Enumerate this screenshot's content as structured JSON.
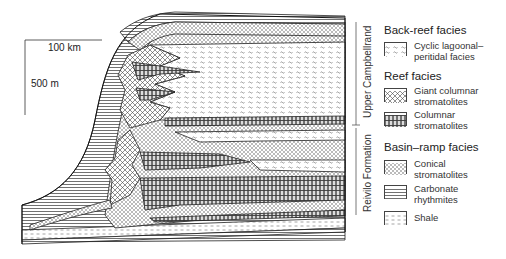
{
  "scale_bar": {
    "horizontal_label": "100 km",
    "vertical_label": "500 m"
  },
  "formations": [
    {
      "label": "Upper Campbellrand"
    },
    {
      "label": "Reivilo Formation"
    }
  ],
  "legend": {
    "groups": [
      {
        "title": "Back-reef facies",
        "items": [
          {
            "label": "Cyclic lagoonal–\nperitidal facies",
            "pattern": "wavy-dash"
          }
        ]
      },
      {
        "title": "Reef facies",
        "items": [
          {
            "label": "Giant columnar\nstromatolites",
            "pattern": "crosshatch"
          },
          {
            "label": "Columnar\nstromatolites",
            "pattern": "columns"
          }
        ]
      },
      {
        "title": "Basin–ramp facies",
        "items": [
          {
            "label": "Conical\nstromatolites",
            "pattern": "small-crosshatch"
          },
          {
            "label": "Carbonate\nrhythmites",
            "pattern": "horizontal-lines"
          },
          {
            "label": "Shale",
            "pattern": "dashes"
          }
        ]
      }
    ]
  },
  "colors": {
    "ink": "#222222",
    "background": "#ffffff"
  }
}
